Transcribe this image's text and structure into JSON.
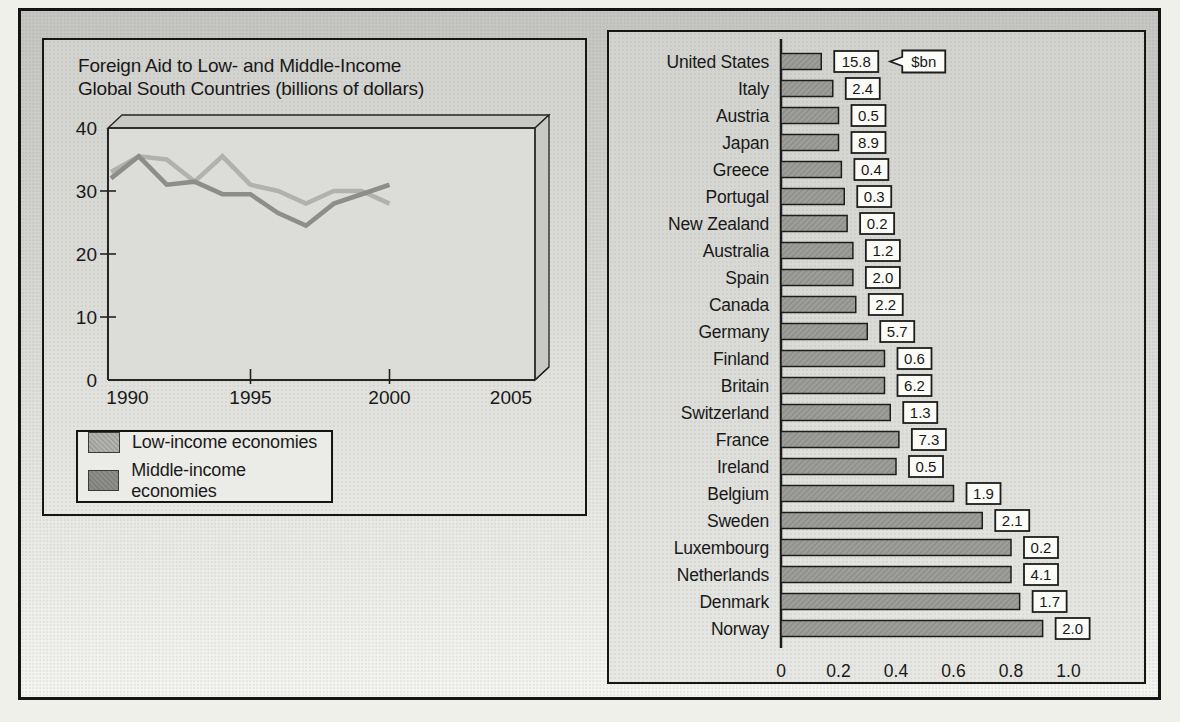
{
  "chart_data": [
    {
      "type": "line",
      "style": "3d-excel",
      "title": "Foreign Aid to Low- and Middle-Income Global South Countries (billions of dollars)",
      "title_lines": [
        "Foreign Aid to Low- and Middle-Income",
        "Global South Countries (billions of dollars)"
      ],
      "x": [
        1990,
        1991,
        1992,
        1993,
        1994,
        1995,
        1996,
        1997,
        1998,
        1999,
        2000
      ],
      "series": [
        {
          "name": "Low-income economies",
          "color": "#b1b1ae",
          "values": [
            33,
            35.5,
            35,
            31.5,
            35.5,
            31,
            30,
            28,
            30,
            30,
            28
          ]
        },
        {
          "name": "Middle-income economies",
          "color": "#8d8d8a",
          "values": [
            32,
            35.5,
            31,
            31.5,
            29.5,
            29.5,
            26.5,
            24.5,
            28,
            29.5,
            31
          ]
        }
      ],
      "xlim": [
        1990,
        2005
      ],
      "ylim": [
        0,
        40
      ],
      "xticks": [
        "1990",
        "1995",
        "2000",
        "2005"
      ],
      "yticks": [
        "0",
        "10",
        "20",
        "30",
        "40"
      ],
      "grid": false,
      "legend_position": "bottom-left"
    },
    {
      "type": "bar",
      "orientation": "horizontal",
      "categories": [
        "United States",
        "Italy",
        "Austria",
        "Japan",
        "Greece",
        "Portugal",
        "New Zealand",
        "Australia",
        "Spain",
        "Canada",
        "Germany",
        "Finland",
        "Britain",
        "Switzerland",
        "France",
        "Ireland",
        "Belgium",
        "Sweden",
        "Luxembourg",
        "Netherlands",
        "Denmark",
        "Norway"
      ],
      "values": [
        0.14,
        0.18,
        0.2,
        0.2,
        0.21,
        0.22,
        0.23,
        0.25,
        0.25,
        0.26,
        0.3,
        0.36,
        0.36,
        0.38,
        0.41,
        0.4,
        0.6,
        0.7,
        0.8,
        0.8,
        0.83,
        0.91
      ],
      "value_labels_bn": [
        "15.8",
        "2.4",
        "0.5",
        "8.9",
        "0.4",
        "0.3",
        "0.2",
        "1.2",
        "2.0",
        "2.2",
        "5.7",
        "0.6",
        "6.2",
        "1.3",
        "7.3",
        "0.5",
        "1.9",
        "2.1",
        "0.2",
        "4.1",
        "1.7",
        "2.0"
      ],
      "unit_callout": "$bn",
      "xlim": [
        0,
        1.0
      ],
      "xticks": [
        "0",
        "0.2",
        "0.4",
        "0.6",
        "0.8",
        "1.0"
      ],
      "bar_color": "#9c9c99",
      "grid": false
    }
  ],
  "colors": {
    "frame_border": "#141414",
    "panel_bg": "#dadad6",
    "plot_bg": "#dcdcd8",
    "wall_shade": "#c8c8c4",
    "value_box_bg": "#fbfbf8",
    "text": "#191919"
  }
}
